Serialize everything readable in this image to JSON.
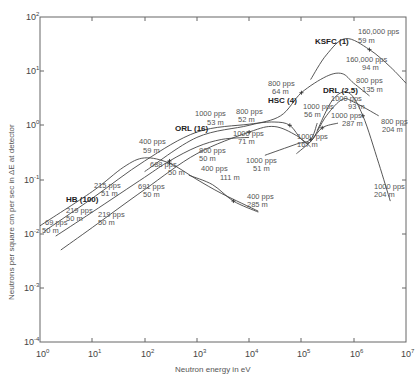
{
  "chart_data": {
    "type": "line",
    "title": "",
    "xlabel": "Neutron energy in eV",
    "ylabel": "Neutrons per square cm per sec in ΔE at detector",
    "x_scale": "log",
    "y_scale": "log",
    "xlim": [
      1,
      10000000
    ],
    "ylim": [
      0.0001,
      100
    ],
    "grid": false,
    "x_ticks": [
      {
        "base": "10",
        "exp": "0"
      },
      {
        "base": "10",
        "exp": "1"
      },
      {
        "base": "10",
        "exp": "2"
      },
      {
        "base": "10",
        "exp": "3"
      },
      {
        "base": "10",
        "exp": "4"
      },
      {
        "base": "10",
        "exp": "5"
      },
      {
        "base": "10",
        "exp": "6"
      },
      {
        "base": "10",
        "exp": "7"
      }
    ],
    "y_ticks": [
      {
        "base": "10",
        "exp": "2"
      },
      {
        "base": "10",
        "exp": "1"
      },
      {
        "base": "10",
        "exp": "0"
      },
      {
        "base": "10",
        "exp": "-1"
      },
      {
        "base": "10",
        "exp": "-2"
      },
      {
        "base": "10",
        "exp": "-3"
      },
      {
        "base": "10",
        "exp": "-4"
      }
    ],
    "source_labels": [
      {
        "text": "HB (100)",
        "x": 1.8,
        "y": 0.065
      },
      {
        "text": "ORL (16)",
        "x": 45,
        "y": 0.8
      },
      {
        "text": "HSC (4)",
        "x": 55000,
        "y": 2.5
      },
      {
        "text": "DRL (2.5)",
        "x": 340000,
        "y": 1.35
      },
      {
        "text": "KSFC (1)",
        "x": 180000,
        "y": 20
      }
    ],
    "series": [
      {
        "name": "HB 69 pps 50 m / 400 pps 59 m",
        "points": [
          [
            1,
            0.014
          ],
          [
            10,
            0.06
          ],
          [
            40,
            0.17
          ],
          [
            100,
            0.25
          ],
          [
            300,
            0.2
          ],
          [
            1000,
            0.1
          ],
          [
            3000,
            0.055
          ],
          [
            15000,
            0.026
          ]
        ]
      },
      {
        "name": "HB 219 pps 50 m / ORL 800 pps 52 m",
        "points": [
          [
            1.2,
            0.011
          ],
          [
            10,
            0.045
          ],
          [
            100,
            0.22
          ],
          [
            1000,
            0.75
          ],
          [
            10000,
            1.05
          ],
          [
            30000,
            1.15
          ],
          [
            60000,
            1.0
          ],
          [
            100000,
            0.55
          ],
          [
            150000,
            0.5
          ],
          [
            300000,
            1.5
          ],
          [
            600000,
            3.0
          ],
          [
            1000000,
            2.7
          ],
          [
            3000000,
            1.5
          ]
        ]
      },
      {
        "name": "HB 215 pps 51 m / 688 pps 50 m",
        "points": [
          [
            2,
            0.009
          ],
          [
            10,
            0.025
          ],
          [
            100,
            0.11
          ],
          [
            300,
            0.22
          ],
          [
            1000,
            0.4
          ],
          [
            3000,
            0.55
          ],
          [
            10000,
            0.6
          ]
        ]
      },
      {
        "name": "HB 219 pps 50 m / 691 pps 50 m / 1000 pps 71 m",
        "points": [
          [
            2.5,
            0.005
          ],
          [
            10,
            0.013
          ],
          [
            100,
            0.065
          ],
          [
            1000,
            0.3
          ],
          [
            10000,
            0.75
          ],
          [
            30000,
            0.95
          ],
          [
            80000,
            0.65
          ],
          [
            150000,
            0.4
          ]
        ]
      },
      {
        "name": "ORL 800 pps 50 m / 1000 pps 53 m",
        "points": [
          [
            100,
            0.14
          ],
          [
            1000,
            0.6
          ],
          [
            10000,
            1.0
          ],
          [
            40000,
            1.5
          ],
          [
            100000,
            4
          ],
          [
            300000,
            8
          ],
          [
            600000,
            9
          ],
          [
            1000000,
            6
          ],
          [
            2000000,
            3.5
          ]
        ]
      },
      {
        "name": "ORL 400 pps 111 m / 400 pps 285 m",
        "points": [
          [
            700,
            0.12
          ],
          [
            2000,
            0.08
          ],
          [
            5000,
            0.04
          ],
          [
            15000,
            0.025
          ]
        ]
      },
      {
        "name": "1000 pps 51 m to 1000 pps 56 m",
        "points": [
          [
            20000,
            0.28
          ],
          [
            80000,
            0.45
          ],
          [
            150000,
            0.55
          ],
          [
            200000,
            1.1
          ]
        ]
      },
      {
        "name": "HSC 1000 pps 167 m / 287 m",
        "points": [
          [
            80000,
            0.3
          ],
          [
            150000,
            0.5
          ],
          [
            250000,
            0.9
          ],
          [
            500000,
            1.1
          ]
        ]
      },
      {
        "name": "DRL 1000 pps 93 m / 204 m",
        "points": [
          [
            200000,
            0.8
          ],
          [
            400000,
            3
          ],
          [
            800000,
            4
          ],
          [
            1500000,
            1.5
          ],
          [
            3000000,
            0.2
          ],
          [
            5000000,
            0.04
          ]
        ]
      },
      {
        "name": "KSFC 160,000 pps 59 m / 94 m",
        "points": [
          [
            150000,
            7
          ],
          [
            300000,
            20
          ],
          [
            700000,
            40
          ],
          [
            2000000,
            25
          ],
          [
            5000000,
            12
          ],
          [
            10000000,
            6
          ]
        ]
      }
    ],
    "annotations": [
      {
        "text1": "69 pps",
        "text2": "50 m"
      },
      {
        "text1": "219 pps",
        "text2": "50 m"
      },
      {
        "text1": "215 pps",
        "text2": "51 m"
      },
      {
        "text1": "219 pps",
        "text2": "50 m"
      },
      {
        "text1": "400 pps",
        "text2": "59 m"
      },
      {
        "text1": "688 pps",
        "text2": "50 m"
      },
      {
        "text1": "691 pps",
        "text2": "50 m"
      },
      {
        "text1": "1000 pps",
        "text2": "53 m"
      },
      {
        "text1": "800 pps",
        "text2": "50 m"
      },
      {
        "text1": "400 pps",
        "text2": "111 m"
      },
      {
        "text1": "800 pps",
        "text2": "52 m"
      },
      {
        "text1": "1000 pps",
        "text2": "71 m"
      },
      {
        "text1": "1000 pps",
        "text2": "51 m"
      },
      {
        "text1": "400 pps",
        "text2": "285 m"
      },
      {
        "text1": "800 pps",
        "text2": "64 m"
      },
      {
        "text1": "1000 pps",
        "text2": "56 m"
      },
      {
        "text1": "1000 pps",
        "text2": "167 m"
      },
      {
        "text1": "1000 pps",
        "text2": "287 m"
      },
      {
        "text1": "1000 pps",
        "text2": "93 m"
      },
      {
        "text1": "800 pps",
        "text2": "135 m"
      },
      {
        "text1": "800 pps",
        "text2": "204 m"
      },
      {
        "text1": "1000 pps",
        "text2": "204 m"
      },
      {
        "text1": "160,000 pps",
        "text2": "59 m"
      },
      {
        "text1": "160,000 pps",
        "text2": "94 m"
      }
    ]
  }
}
